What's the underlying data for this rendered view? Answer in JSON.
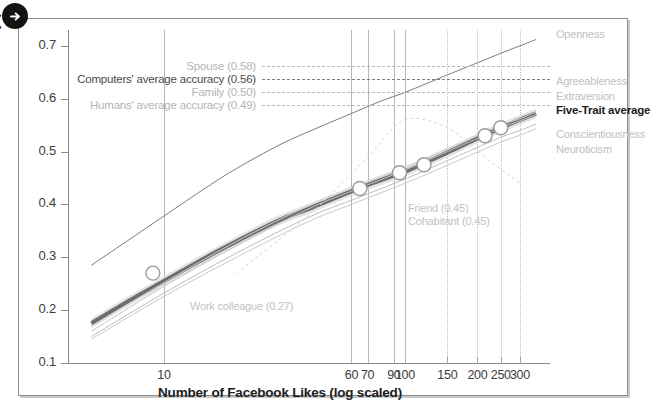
{
  "badge": {
    "icon": "arrow-right-icon"
  },
  "axes": {
    "ylabel": "Accuracy (self-other agreement)",
    "xlabel": "Number of Facebook Likes (log scaled)",
    "yticks": [
      "0.7",
      "0.6",
      "0.5",
      "0.4",
      "0.3",
      "0.2",
      "0.1"
    ],
    "xticks": [
      "10",
      "60",
      "70",
      "90",
      "100",
      "150",
      "200",
      "250",
      "300"
    ]
  },
  "reference_lines": [
    {
      "label": "Spouse (0.58)",
      "value": 0.58,
      "style": "light"
    },
    {
      "label": "Computers' average accuracy (0.56)",
      "value": 0.56,
      "style": "dark"
    },
    {
      "label": "Family (0.50)",
      "value": 0.5,
      "style": "light"
    },
    {
      "label": "Humans' average accuracy (0.49)",
      "value": 0.49,
      "style": "light"
    }
  ],
  "annotations": [
    {
      "label": "Work colleague (0.27)",
      "value": 0.27
    },
    {
      "label": "Friend (0.45)",
      "value": 0.45
    },
    {
      "label": "Cohabitant (0.45)",
      "value": 0.45
    }
  ],
  "legend": [
    {
      "label": "Openness",
      "emphasis": false
    },
    {
      "label": "Agreeableness",
      "emphasis": false
    },
    {
      "label": "Extraversion",
      "emphasis": false
    },
    {
      "label": "Five-Trait average",
      "emphasis": true
    },
    {
      "label": "Conscientiousness",
      "emphasis": false
    },
    {
      "label": "Neuroticism",
      "emphasis": false
    }
  ],
  "chart_data": {
    "type": "line",
    "title": "",
    "xlabel": "Number of Facebook Likes (log scaled)",
    "ylabel": "Accuracy (self-other agreement)",
    "xscale": "log",
    "xlim": [
      4,
      400
    ],
    "ylim": [
      0.1,
      0.73
    ],
    "xticks": [
      10,
      60,
      70,
      90,
      100,
      150,
      200,
      250,
      300
    ],
    "yticks": [
      0.1,
      0.2,
      0.3,
      0.4,
      0.5,
      0.6,
      0.7
    ],
    "grid": "vertical-only",
    "legend_position": "right",
    "series": [
      {
        "name": "Five-Trait average",
        "emphasis": true,
        "color": "#6d6d6d",
        "band": true,
        "x": [
          5,
          7,
          10,
          15,
          20,
          30,
          40,
          60,
          70,
          90,
          100,
          150,
          200,
          250,
          300,
          350
        ],
        "y": [
          0.175,
          0.215,
          0.255,
          0.3,
          0.33,
          0.37,
          0.392,
          0.425,
          0.437,
          0.455,
          0.462,
          0.498,
          0.525,
          0.545,
          0.56,
          0.572
        ]
      },
      {
        "name": "Openness",
        "emphasis": false,
        "color": "#7a7a7a",
        "x": [
          5,
          7,
          10,
          15,
          20,
          30,
          40,
          60,
          80,
          100,
          150,
          200,
          250,
          300,
          350
        ],
        "y": [
          0.285,
          0.33,
          0.378,
          0.432,
          0.468,
          0.512,
          0.538,
          0.572,
          0.596,
          0.612,
          0.645,
          0.668,
          0.686,
          0.7,
          0.712
        ]
      },
      {
        "name": "Agreeableness",
        "emphasis": false,
        "color": "#c4c4c4",
        "x": [
          5,
          10,
          20,
          40,
          60,
          100,
          150,
          200,
          250,
          300,
          350
        ],
        "y": [
          0.16,
          0.245,
          0.322,
          0.392,
          0.425,
          0.465,
          0.5,
          0.525,
          0.545,
          0.558,
          0.57
        ]
      },
      {
        "name": "Extraversion",
        "emphasis": false,
        "color": "#cfcfcf",
        "x": [
          5,
          10,
          20,
          40,
          60,
          100,
          150,
          200,
          250,
          300,
          350
        ],
        "y": [
          0.17,
          0.252,
          0.33,
          0.398,
          0.43,
          0.47,
          0.505,
          0.53,
          0.55,
          0.562,
          0.575
        ]
      },
      {
        "name": "Conscientiousness",
        "emphasis": false,
        "color": "#bdbdbd",
        "x": [
          5,
          10,
          20,
          40,
          60,
          100,
          150,
          200,
          250,
          300,
          350
        ],
        "y": [
          0.15,
          0.232,
          0.308,
          0.376,
          0.408,
          0.448,
          0.483,
          0.508,
          0.527,
          0.54,
          0.552
        ]
      },
      {
        "name": "Neuroticism",
        "emphasis": false,
        "color": "#c9c9c9",
        "x": [
          5,
          10,
          20,
          40,
          60,
          100,
          150,
          200,
          250,
          300,
          350
        ],
        "y": [
          0.145,
          0.226,
          0.3,
          0.368,
          0.4,
          0.44,
          0.474,
          0.499,
          0.518,
          0.531,
          0.543
        ]
      },
      {
        "name": "Human accuracy reference curve",
        "emphasis": false,
        "color": "#d4d4d4",
        "dashed": true,
        "x": [
          20,
          40,
          70,
          100,
          150,
          200,
          300
        ],
        "y": [
          0.27,
          0.38,
          0.49,
          0.56,
          0.545,
          0.5,
          0.44
        ]
      }
    ],
    "markers": [
      {
        "x": 9,
        "y": 0.27,
        "label": "Work colleague (0.27)"
      },
      {
        "x": 65,
        "y": 0.43,
        "label": ""
      },
      {
        "x": 95,
        "y": 0.46,
        "label": "Friend (0.45)"
      },
      {
        "x": 120,
        "y": 0.475,
        "label": "Cohabitant (0.45)"
      },
      {
        "x": 215,
        "y": 0.53,
        "label": ""
      },
      {
        "x": 250,
        "y": 0.545,
        "label": "Spouse (0.58)"
      }
    ]
  }
}
